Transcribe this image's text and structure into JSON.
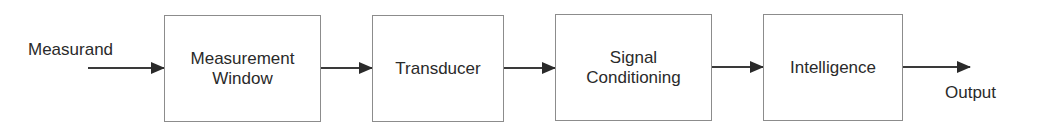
{
  "diagram": {
    "type": "block-flow",
    "input_label": "Measurand",
    "output_label": "Output",
    "blocks": [
      {
        "lines": [
          "Measurement",
          "Window"
        ]
      },
      {
        "lines": [
          "Transducer"
        ]
      },
      {
        "lines": [
          "Signal",
          "Conditioning"
        ]
      },
      {
        "lines": [
          "Intelligence"
        ]
      }
    ],
    "edges": [
      {
        "from": "Measurand",
        "to": "Measurement Window"
      },
      {
        "from": "Measurement Window",
        "to": "Transducer"
      },
      {
        "from": "Transducer",
        "to": "Signal Conditioning"
      },
      {
        "from": "Signal Conditioning",
        "to": "Intelligence"
      },
      {
        "from": "Intelligence",
        "to": "Output"
      }
    ],
    "colors": {
      "line": "#3a3a3a",
      "box_border": "#8c8c8c",
      "text": "#2a2a2a",
      "background": "#ffffff"
    }
  }
}
